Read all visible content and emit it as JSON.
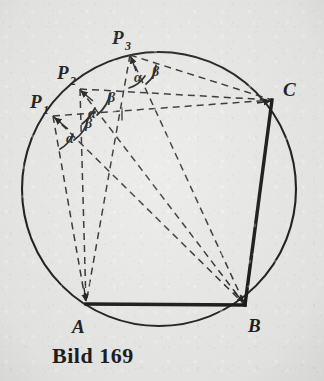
{
  "figure": {
    "caption": "Bild 169",
    "kind": "euclidean-geometry-construction",
    "ink_color": "#1a1a1a",
    "paper_color": "#e9e9e7"
  },
  "labels": {
    "p1": {
      "base": "P",
      "sub": "1",
      "x": 30,
      "y": 108
    },
    "p2": {
      "base": "P",
      "sub": "2",
      "x": 57,
      "y": 79
    },
    "p3": {
      "base": "P",
      "sub": "3",
      "x": 112,
      "y": 44
    },
    "a": {
      "text": "A",
      "x": 72,
      "y": 333
    },
    "b": {
      "text": "B",
      "x": 248,
      "y": 332
    },
    "c": {
      "text": "C",
      "x": 283,
      "y": 96
    }
  },
  "angles": [
    {
      "vertex": "P1",
      "alpha": "α",
      "beta": "β",
      "alpha_x": 66,
      "alpha_y": 143,
      "beta_x": 85,
      "beta_y": 128
    },
    {
      "vertex": "P2",
      "alpha": "α",
      "beta": "β",
      "alpha_x": 88,
      "alpha_y": 118,
      "beta_x": 108,
      "beta_y": 102
    },
    {
      "vertex": "P3",
      "alpha": "α",
      "beta": "β",
      "alpha_x": 134,
      "alpha_y": 82,
      "beta_x": 152,
      "beta_y": 76
    }
  ],
  "geometry": {
    "circle": {
      "cx": 159,
      "cy": 189,
      "r": 137
    },
    "points": {
      "A": {
        "x": 86,
        "y": 304
      },
      "B": {
        "x": 245,
        "y": 305
      },
      "C": {
        "x": 272,
        "y": 100
      },
      "P1": {
        "x": 53,
        "y": 116
      },
      "P2": {
        "x": 80,
        "y": 89
      },
      "P3": {
        "x": 130,
        "y": 55
      }
    },
    "solid_segments": [
      {
        "name": "AB",
        "from": "A",
        "to": "B"
      },
      {
        "name": "BC",
        "from": "B",
        "to": "C"
      }
    ],
    "dashed_segments": [
      {
        "name": "P1-A",
        "from": "P1",
        "to": "A"
      },
      {
        "name": "P1-B",
        "from": "P1",
        "to": "B"
      },
      {
        "name": "P1-C",
        "from": "P1",
        "to": "C"
      },
      {
        "name": "P2-A",
        "from": "P2",
        "to": "A"
      },
      {
        "name": "P2-B",
        "from": "P2",
        "to": "B"
      },
      {
        "name": "P2-C",
        "from": "P2",
        "to": "C"
      },
      {
        "name": "P3-A",
        "from": "P3",
        "to": "A"
      },
      {
        "name": "P3-B",
        "from": "P3",
        "to": "B"
      },
      {
        "name": "P3-C",
        "from": "P3",
        "to": "C"
      }
    ],
    "tick_mark": {
      "x": 122,
      "y": 114
    }
  }
}
